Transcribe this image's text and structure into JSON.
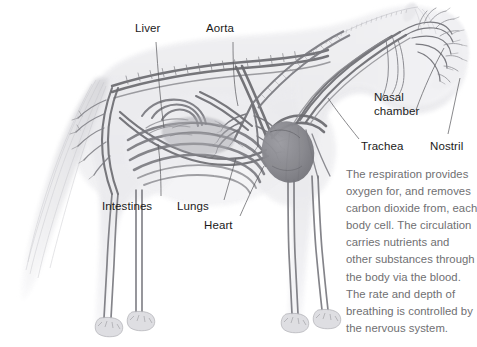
{
  "figure": {
    "labels": [
      {
        "id": "liver",
        "text": "Liver"
      },
      {
        "id": "aorta",
        "text": "Aorta"
      },
      {
        "id": "nasal-chamber",
        "text": "Nasal\nchamber"
      },
      {
        "id": "trachea",
        "text": "Trachea"
      },
      {
        "id": "nostril",
        "text": "Nostril"
      },
      {
        "id": "intestines",
        "text": "Intestines"
      },
      {
        "id": "lungs",
        "text": "Lungs"
      },
      {
        "id": "heart",
        "text": "Heart"
      }
    ],
    "description_lines": [
      "The respiration provides",
      "oxygen for, and removes",
      "carbon dioxide from, each",
      "body cell. The circulation",
      "carries nutrients and",
      "other substances through",
      "the body via the blood.",
      "The rate and depth of",
      "breathing is controlled by",
      "the nervous system."
    ],
    "colors": {
      "label_text": "#1a1a1a",
      "body_text": "#6f6f72",
      "leader_line": "#5a5a5e",
      "vessel_dark": "#6b6b70",
      "vessel_mid": "#8d8d92",
      "body_wash": "#e9e9ec",
      "heart_fill": "#85858b",
      "background": "#ffffff"
    }
  }
}
